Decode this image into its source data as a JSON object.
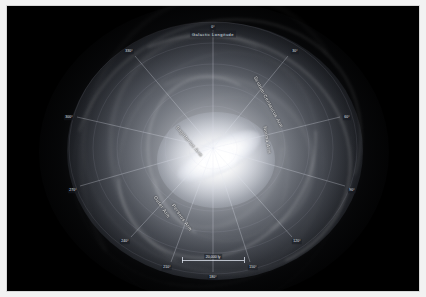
{
  "image": {
    "subject": "Milky Way Galaxy",
    "description": "Artist's concept face-on view of the barred spiral Milky Way Galaxy overlaid with a galactic longitude polar coordinate grid",
    "background_color": "#000000",
    "border_color": "#ffffff"
  },
  "grid": {
    "title": "Galactic Longitude",
    "center_degree": "0°",
    "degree_labels": [
      {
        "label": "0°",
        "angle": 0,
        "x": 206,
        "y": 22
      },
      {
        "label": "30°",
        "angle": 30,
        "x": 288,
        "y": 46
      },
      {
        "label": "60°",
        "angle": 60,
        "x": 340,
        "y": 112
      },
      {
        "label": "90°",
        "angle": 90,
        "x": 345,
        "y": 185
      },
      {
        "label": "120°",
        "angle": 120,
        "x": 290,
        "y": 236
      },
      {
        "label": "150°",
        "angle": 150,
        "x": 246,
        "y": 262
      },
      {
        "label": "180°",
        "angle": 180,
        "x": 206,
        "y": 272
      },
      {
        "label": "210°",
        "angle": 210,
        "x": 160,
        "y": 262
      },
      {
        "label": "240°",
        "angle": 240,
        "x": 118,
        "y": 236
      },
      {
        "label": "270°",
        "angle": 270,
        "x": 66,
        "y": 185
      },
      {
        "label": "300°",
        "angle": 300,
        "x": 62,
        "y": 112
      },
      {
        "label": "330°",
        "angle": 330,
        "x": 122,
        "y": 46
      }
    ]
  },
  "scale": {
    "label": "20,000 ly",
    "unit": "light years"
  },
  "arms": [
    {
      "name": "Scutum-Centaurus Arm",
      "x": 248,
      "y": 68,
      "rotation": 62
    },
    {
      "name": "Norma Arm",
      "x": 258,
      "y": 118,
      "rotation": 80
    },
    {
      "name": "Sagittarius Arm",
      "x": 170,
      "y": 118,
      "rotation": 50
    },
    {
      "name": "Outer Arm",
      "x": 148,
      "y": 188,
      "rotation": 56
    },
    {
      "name": "Perseus Arm",
      "x": 166,
      "y": 196,
      "rotation": 55
    }
  ]
}
